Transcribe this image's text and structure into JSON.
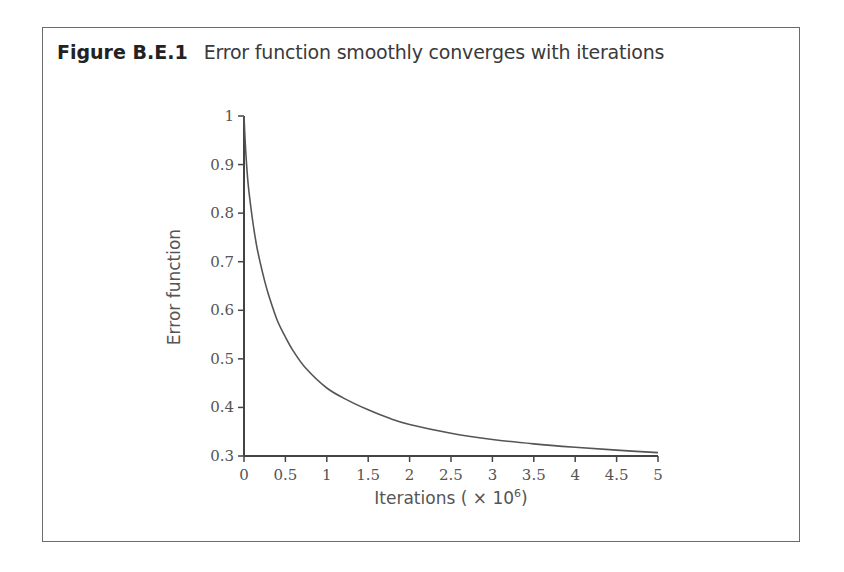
{
  "figure": {
    "number": "Figure B.E.1",
    "caption": "Error function smoothly converges with iterations"
  },
  "axes": {
    "xlabel": "Iterations ( × 10",
    "xlabel_exponent": "6",
    "xlabel_close": ")",
    "ylabel": "Error function"
  },
  "chart_data": {
    "type": "line",
    "title": "Error function smoothly converges with iterations",
    "xlabel": "Iterations (× 10^6)",
    "ylabel": "Error function",
    "xlim": [
      0,
      5
    ],
    "ylim": [
      0.3,
      1
    ],
    "grid": false,
    "legend": null,
    "x_ticks": [
      "0",
      "0.5",
      "1",
      "1.5",
      "2",
      "2.5",
      "3",
      "3.5",
      "4",
      "4.5",
      "5"
    ],
    "y_ticks": [
      "0.3",
      "0.4",
      "0.5",
      "0.6",
      "0.7",
      "0.8",
      "0.9",
      "1"
    ],
    "series": [
      {
        "name": "Error function",
        "color": "#555555",
        "x": [
          0,
          0.02,
          0.05,
          0.1,
          0.15,
          0.2,
          0.25,
          0.3,
          0.4,
          0.5,
          0.6,
          0.75,
          1.0,
          1.25,
          1.5,
          1.75,
          2.0,
          2.5,
          3.0,
          3.5,
          4.0,
          4.5,
          5.0
        ],
        "values": [
          1.0,
          0.93,
          0.86,
          0.79,
          0.735,
          0.695,
          0.66,
          0.63,
          0.58,
          0.545,
          0.515,
          0.48,
          0.44,
          0.415,
          0.395,
          0.378,
          0.365,
          0.347,
          0.334,
          0.325,
          0.318,
          0.312,
          0.307
        ]
      }
    ]
  }
}
